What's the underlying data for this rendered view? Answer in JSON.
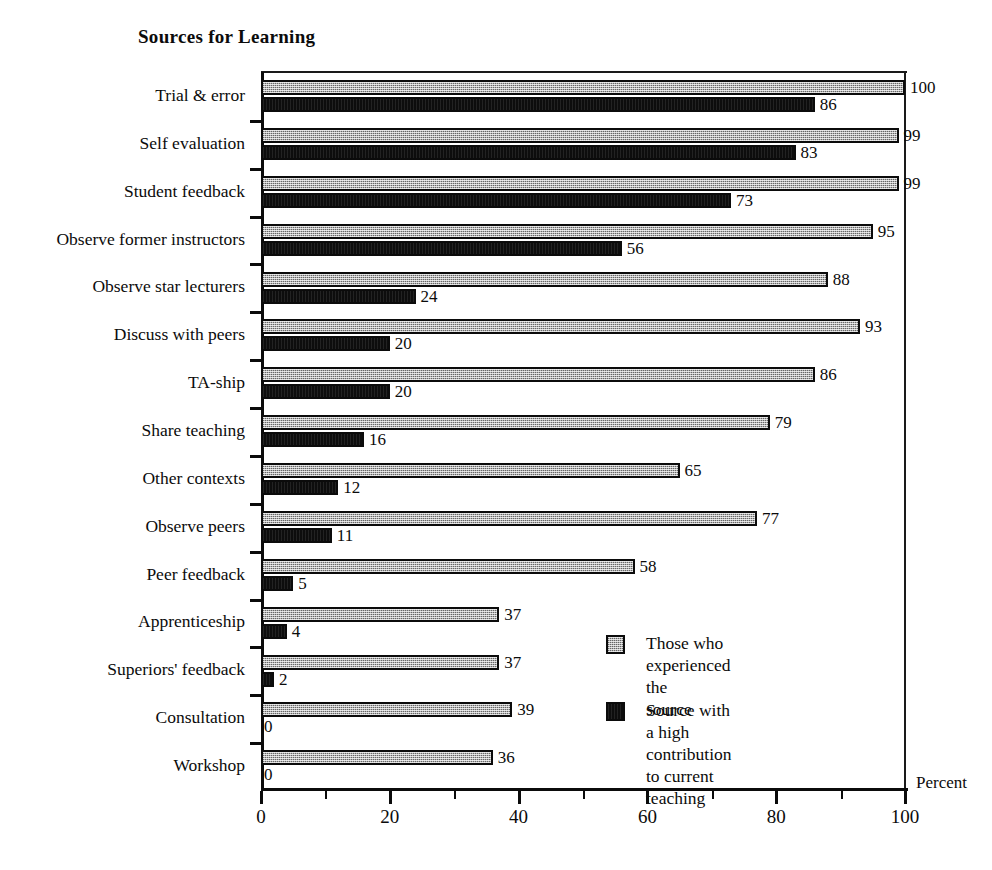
{
  "chart_data": {
    "type": "bar",
    "orientation": "horizontal",
    "title": "Sources for Learning",
    "xlabel": "Percent",
    "ylabel": "",
    "xlim": [
      0,
      100
    ],
    "xticks": [
      0,
      20,
      40,
      60,
      80,
      100
    ],
    "xtick_labels": [
      "0",
      "20",
      "40",
      "60",
      "80",
      "100"
    ],
    "minor_xticks": [
      10,
      30,
      50,
      70,
      90
    ],
    "grid": false,
    "legend_position": "inside-lower-right",
    "categories": [
      "Trial & error",
      "Self evaluation",
      "Student feedback",
      "Observe former instructors",
      "Observe star lecturers",
      "Discuss with peers",
      "TA-ship",
      "Share teaching",
      "Other contexts",
      "Observe peers",
      "Peer feedback",
      "Apprenticeship",
      "Superiors' feedback",
      "Consultation",
      "Workshop"
    ],
    "series": [
      {
        "name": "Those who experienced the source",
        "color": "#b4b4b4",
        "values": [
          100,
          99,
          99,
          95,
          88,
          93,
          86,
          79,
          65,
          77,
          58,
          37,
          37,
          39,
          36
        ]
      },
      {
        "name": "Source with a high contribution to current teaching",
        "color": "#0d0d0d",
        "values": [
          86,
          83,
          73,
          56,
          24,
          20,
          20,
          16,
          12,
          11,
          5,
          4,
          2,
          0,
          0
        ]
      }
    ]
  },
  "legend": {
    "entries": [
      {
        "swatch": "light-gray-stipple",
        "label": "Those who experienced the\nsource"
      },
      {
        "swatch": "solid-black",
        "label": "Source with a high contribution\nto current teaching"
      }
    ]
  }
}
